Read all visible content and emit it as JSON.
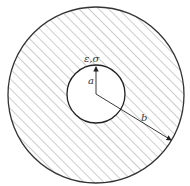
{
  "diagram": {
    "type": "annular cross-section",
    "outer_circle": {
      "cx": 96,
      "cy": 95,
      "r": 88
    },
    "inner_circle": {
      "cx": 96,
      "cy": 94,
      "r": 29
    },
    "hatch": {
      "angle_deg": 45,
      "spacing": 7,
      "color": "#9a9a9a"
    },
    "stroke_color": "#333333",
    "labels": {
      "inner_quantity": "ε,σ",
      "inner_radius": "a",
      "outer_radius": "b"
    }
  }
}
